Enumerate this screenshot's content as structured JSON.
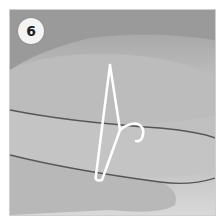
{
  "step": {
    "number": "6"
  },
  "image": {
    "subject": "hand-holding-wire-hanger"
  },
  "colors": {
    "background": "#ffffff",
    "badge": "#f4f4f4",
    "wire": "#ffffff",
    "skin": "#bdbdbd"
  }
}
